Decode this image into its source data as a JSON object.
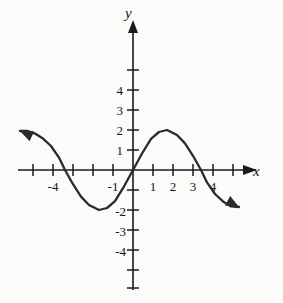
{
  "figure": {
    "background_color": "#fbfbfa",
    "ink_color": "#1a1a1a",
    "curve_color": "#2b2b2b"
  },
  "axes": {
    "x_axis_label": "x",
    "y_axis_label": "y",
    "origin_px": [
      133,
      170
    ],
    "unit_px": 20,
    "x_label_values": [
      "-4",
      "-1",
      "1",
      "2",
      "3",
      "4"
    ],
    "y_label_values": [
      "4",
      "3",
      "2",
      "1",
      "-2",
      "-3",
      "-4"
    ],
    "x_tick_values": [
      -5,
      -4,
      -3,
      -2,
      -1,
      1,
      2,
      3,
      4,
      5
    ],
    "y_tick_values": [
      -6,
      -5,
      -4,
      -3,
      -2,
      -1,
      1,
      2,
      3,
      4,
      5
    ],
    "x_range": [
      -5.9,
      6.3
    ],
    "y_range": [
      -6.3,
      5.6
    ],
    "grid": false
  },
  "chart_data": {
    "type": "line",
    "title": "",
    "xlabel": "x",
    "ylabel": "y",
    "xlim": [
      -5.9,
      6.3
    ],
    "ylim": [
      -6.3,
      5.6
    ],
    "grid": false,
    "legend": "none",
    "series": [
      {
        "name": "sine wave",
        "description": "y = 2 sin(pi x / 3.4), amplitude 2, period approx 6.8",
        "amplitude": 2,
        "period": 6.8,
        "zeros": [
          -3.4,
          0,
          3.4
        ],
        "minimum": {
          "x": -1.7,
          "y": -2
        },
        "maximum": {
          "x": 1.7,
          "y": 2
        },
        "left_endpoint_arrow": {
          "x": -5.65,
          "y": 1.95,
          "direction": "up-left"
        },
        "right_endpoint_arrow": {
          "x": 5.3,
          "y": -1.85,
          "direction": "down-right"
        },
        "x": [
          -5.65,
          -5.3,
          -4.9,
          -4.5,
          -4.1,
          -3.7,
          -3.4,
          -3.0,
          -2.6,
          -2.2,
          -1.7,
          -1.3,
          -0.9,
          -0.5,
          0,
          0.5,
          0.9,
          1.3,
          1.7,
          2.2,
          2.6,
          3.0,
          3.4,
          3.7,
          4.1,
          4.5,
          4.9,
          5.3
        ],
        "y": [
          1.95,
          1.96,
          1.82,
          1.57,
          1.2,
          0.62,
          0,
          -0.71,
          -1.33,
          -1.75,
          -2.0,
          -1.9,
          -1.56,
          -0.91,
          0,
          0.91,
          1.56,
          1.9,
          2.0,
          1.75,
          1.33,
          0.71,
          0,
          -0.62,
          -1.2,
          -1.57,
          -1.82,
          -1.85
        ]
      }
    ]
  },
  "tick_labels": {
    "x": [
      {
        "value": "-4",
        "x": -4
      },
      {
        "value": "-1",
        "x": -1
      },
      {
        "value": "1",
        "x": 1
      },
      {
        "value": "2",
        "x": 2
      },
      {
        "value": "3",
        "x": 3
      },
      {
        "value": "4",
        "x": 4
      }
    ],
    "y": [
      {
        "value": "4",
        "y": 4
      },
      {
        "value": "3",
        "y": 3
      },
      {
        "value": "2",
        "y": 2
      },
      {
        "value": "1",
        "y": 1
      },
      {
        "value": "-2",
        "y": -2
      },
      {
        "value": "-3",
        "y": -3
      },
      {
        "value": "-4",
        "y": -4
      }
    ]
  }
}
